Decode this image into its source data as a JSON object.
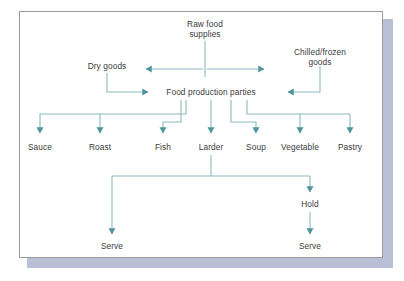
{
  "diagram": {
    "colors": {
      "line": "#5a9aa0",
      "line_light": "#8fc0c4",
      "text": "#3a3a3a",
      "frame_border": "#9a9a9a",
      "shadow": "#b9bfd4",
      "background": "#ffffff"
    },
    "nodes": [
      {
        "id": "raw-food-supplies",
        "label_line1": "Raw food",
        "label_line2": "supplies",
        "x": 205,
        "y": 24,
        "type": "source"
      },
      {
        "id": "dry-goods",
        "label_line1": "Dry goods",
        "label_line2": "",
        "x": 107,
        "y": 66,
        "type": "store"
      },
      {
        "id": "chilled-frozen-goods",
        "label_line1": "Chilled/frozen",
        "label_line2": "goods",
        "x": 320,
        "y": 52,
        "type": "store"
      },
      {
        "id": "food-production-parties",
        "label_line1": "Food production parties",
        "label_line2": "",
        "x": 211,
        "y": 93,
        "type": "process"
      },
      {
        "id": "sauce",
        "label_line1": "Sauce",
        "label_line2": "",
        "x": 40,
        "y": 148,
        "type": "party"
      },
      {
        "id": "roast",
        "label_line1": "Roast",
        "label_line2": "",
        "x": 100,
        "y": 148,
        "type": "party"
      },
      {
        "id": "fish",
        "label_line1": "Fish",
        "label_line2": "",
        "x": 163,
        "y": 148,
        "type": "party"
      },
      {
        "id": "larder",
        "label_line1": "Larder",
        "label_line2": "",
        "x": 211,
        "y": 148,
        "type": "party"
      },
      {
        "id": "soup",
        "label_line1": "Soup",
        "label_line2": "",
        "x": 256,
        "y": 148,
        "type": "party"
      },
      {
        "id": "vegetable",
        "label_line1": "Vegetable",
        "label_line2": "",
        "x": 300,
        "y": 148,
        "type": "party"
      },
      {
        "id": "pastry",
        "label_line1": "Pastry",
        "label_line2": "",
        "x": 350,
        "y": 148,
        "type": "party"
      },
      {
        "id": "hold",
        "label_line1": "Hold",
        "label_line2": "",
        "x": 310,
        "y": 205,
        "type": "stage"
      },
      {
        "id": "serve-left",
        "label_line1": "Serve",
        "label_line2": "",
        "x": 112,
        "y": 247,
        "type": "terminal"
      },
      {
        "id": "serve-right",
        "label_line1": "Serve",
        "label_line2": "",
        "x": 310,
        "y": 247,
        "type": "terminal"
      }
    ],
    "edges": [
      {
        "id": "raw-to-stores",
        "from": "raw-food-supplies",
        "to": "dry-goods-and-chilled-frozen-goods",
        "style": "double-arrow-horizontal"
      },
      {
        "id": "dry-goods-to-parties",
        "from": "dry-goods",
        "to": "food-production-parties",
        "style": "elbow-right-arrow"
      },
      {
        "id": "chilled-to-parties",
        "from": "chilled-frozen-goods",
        "to": "food-production-parties",
        "style": "elbow-left-arrow"
      },
      {
        "id": "parties-to-sauce",
        "from": "food-production-parties",
        "to": "sauce",
        "style": "bus-drop-arrow"
      },
      {
        "id": "parties-to-roast",
        "from": "food-production-parties",
        "to": "roast",
        "style": "bus-drop-arrow"
      },
      {
        "id": "parties-to-fish",
        "from": "food-production-parties",
        "to": "fish",
        "style": "elbow-drop-arrow"
      },
      {
        "id": "parties-to-larder",
        "from": "food-production-parties",
        "to": "larder",
        "style": "straight-drop-arrow"
      },
      {
        "id": "parties-to-soup",
        "from": "food-production-parties",
        "to": "soup",
        "style": "elbow-drop-arrow"
      },
      {
        "id": "parties-to-vegetable",
        "from": "food-production-parties",
        "to": "vegetable",
        "style": "bus-drop-arrow"
      },
      {
        "id": "parties-to-pastry",
        "from": "food-production-parties",
        "to": "pastry",
        "style": "bus-drop-arrow"
      },
      {
        "id": "larder-to-serve",
        "from": "larder",
        "to": "serve-left",
        "style": "bus-drop-arrow"
      },
      {
        "id": "larder-to-hold",
        "from": "larder",
        "to": "hold",
        "style": "bus-drop-arrow"
      },
      {
        "id": "hold-to-serve",
        "from": "hold",
        "to": "serve-right",
        "style": "straight-drop-arrow"
      }
    ]
  }
}
